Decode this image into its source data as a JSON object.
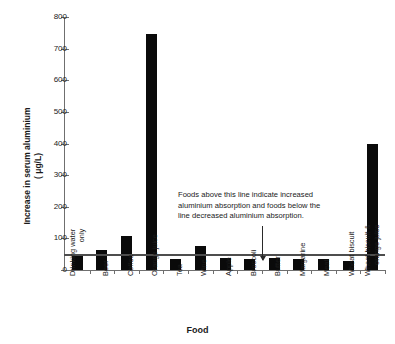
{
  "chart_data": {
    "type": "bar",
    "title": "",
    "xlabel": "Food",
    "ylabel_line1": "Increase in serum aluminium",
    "ylabel_line2": "( μg/L)",
    "ylim": [
      0,
      800
    ],
    "yticks": [
      0,
      100,
      200,
      300,
      400,
      500,
      600,
      700,
      800
    ],
    "grid": false,
    "legend": "none",
    "categories": [
      "Drinking water only",
      "Beer",
      "Coffee",
      "Orange juice",
      "Tea",
      "Wine",
      "Apple",
      "Broccoli",
      "Butter",
      "Margarine",
      "Meat",
      "Wheat biscuit",
      "Wheat biscuit & orange juice"
    ],
    "category_lines": [
      [
        "Drinking water",
        "only"
      ],
      [
        "Beer"
      ],
      [
        "Coffee"
      ],
      [
        "Orange juice"
      ],
      [
        "Tea"
      ],
      [
        "Wine"
      ],
      [
        "Apple"
      ],
      [
        "Broccoli"
      ],
      [
        "Butter"
      ],
      [
        "Margarine"
      ],
      [
        "Meat"
      ],
      [
        "Wheat biscuit"
      ],
      [
        "Wheat biscuit &",
        "orange juice"
      ]
    ],
    "values": [
      50,
      63,
      107,
      745,
      35,
      76,
      38,
      35,
      37,
      35,
      35,
      30,
      400
    ],
    "reference_line": 50,
    "bar_color": "#0a0a0a",
    "axis_color": "#6f6f6f",
    "annotation": {
      "line1": "Foods above this line indicate increased",
      "line2": "aluminium absorption and foods below the",
      "line3": "line decreased aluminium absorption."
    }
  }
}
